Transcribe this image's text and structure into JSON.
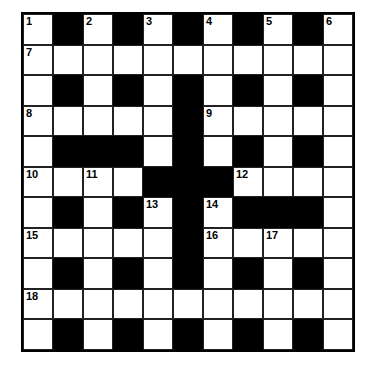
{
  "puzzle": {
    "rows": 11,
    "cols": 11,
    "colors": {
      "black": "#000000",
      "white": "#ffffff"
    },
    "layout": [
      "W.W.W.W.W.W",
      "WWWWWWWWWWW",
      "W.W.W.W.W.W",
      "WWWWW.WWWWW",
      "W...W.W.W.W",
      "WWWW...WWWW",
      "W.W.W.W...W",
      "WWWWW.WWWWW",
      "W.W.W.W.W.W",
      "WWWWWWWWWWW",
      "W.W.W.W.W.W"
    ],
    "numbers": [
      {
        "row": 0,
        "col": 0,
        "n": "1"
      },
      {
        "row": 0,
        "col": 2,
        "n": "2"
      },
      {
        "row": 0,
        "col": 4,
        "n": "3"
      },
      {
        "row": 0,
        "col": 6,
        "n": "4"
      },
      {
        "row": 0,
        "col": 8,
        "n": "5"
      },
      {
        "row": 0,
        "col": 10,
        "n": "6"
      },
      {
        "row": 1,
        "col": 0,
        "n": "7"
      },
      {
        "row": 3,
        "col": 0,
        "n": "8"
      },
      {
        "row": 3,
        "col": 6,
        "n": "9"
      },
      {
        "row": 5,
        "col": 0,
        "n": "10"
      },
      {
        "row": 5,
        "col": 2,
        "n": "11"
      },
      {
        "row": 5,
        "col": 7,
        "n": "12"
      },
      {
        "row": 6,
        "col": 4,
        "n": "13"
      },
      {
        "row": 6,
        "col": 6,
        "n": "14"
      },
      {
        "row": 7,
        "col": 0,
        "n": "15"
      },
      {
        "row": 7,
        "col": 6,
        "n": "16"
      },
      {
        "row": 7,
        "col": 8,
        "n": "17"
      },
      {
        "row": 9,
        "col": 0,
        "n": "18"
      }
    ]
  }
}
